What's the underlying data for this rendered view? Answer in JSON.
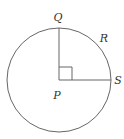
{
  "diagram": {
    "type": "circle-with-right-angle",
    "center": {
      "label": "P",
      "x": 59,
      "y": 80
    },
    "radius": 52,
    "points": [
      {
        "label": "Q",
        "x": 59,
        "y": 28,
        "label_x": 58,
        "label_y": 21
      },
      {
        "label": "R",
        "x": 97,
        "y": 44,
        "label_x": 104,
        "label_y": 42
      },
      {
        "label": "S",
        "x": 111,
        "y": 80,
        "label_x": 118,
        "label_y": 84
      }
    ],
    "segments": [
      "PQ",
      "PS"
    ],
    "right_angle_at": "P",
    "stroke_color": "#666666"
  }
}
